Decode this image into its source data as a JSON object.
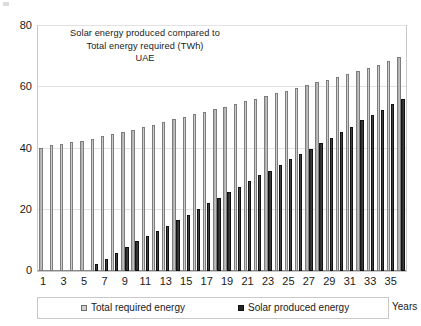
{
  "chart_data": {
    "type": "bar",
    "title": "Solar energy produced compared to Total energy required (TWh) UAE",
    "title_lines": [
      "Solar energy produced compared to",
      "Total energy required (TWh)",
      "UAE"
    ],
    "xlabel": "Years",
    "ylabel": "",
    "ylim": [
      0,
      80
    ],
    "yticks": [
      0,
      20,
      40,
      60,
      80
    ],
    "xticks": [
      1,
      3,
      5,
      7,
      9,
      11,
      13,
      15,
      17,
      19,
      21,
      23,
      25,
      27,
      29,
      31,
      33,
      35
    ],
    "grid": true,
    "legend_position": "bottom",
    "categories": [
      1,
      2,
      3,
      4,
      5,
      6,
      7,
      8,
      9,
      10,
      11,
      12,
      13,
      14,
      15,
      16,
      17,
      18,
      19,
      20,
      21,
      22,
      23,
      24,
      25,
      26,
      27,
      28,
      29,
      30,
      31,
      32,
      33,
      34,
      35,
      36
    ],
    "series": [
      {
        "name": "Total required energy",
        "color": "#bdbdbd",
        "values": [
          40.3,
          41.0,
          41.6,
          42.1,
          42.6,
          43.2,
          44.0,
          44.7,
          45.4,
          46.2,
          47.1,
          47.8,
          48.8,
          49.6,
          50.4,
          51.3,
          52.0,
          53.0,
          53.6,
          54.6,
          55.4,
          56.2,
          57.2,
          58.0,
          58.9,
          59.8,
          60.8,
          61.7,
          62.5,
          63.3,
          64.3,
          65.3,
          66.3,
          67.3,
          68.5,
          70.0
        ]
      },
      {
        "name": "Solar produced energy",
        "color": "#242424",
        "values": [
          0,
          0,
          0,
          0,
          0,
          2.2,
          3.8,
          5.8,
          7.9,
          9.7,
          11.5,
          13.0,
          14.8,
          16.8,
          18.4,
          20.3,
          22.2,
          23.8,
          25.8,
          27.4,
          29.5,
          31.3,
          32.8,
          34.7,
          36.5,
          38.3,
          40.0,
          41.7,
          43.4,
          45.3,
          47.1,
          49.2,
          51.0,
          52.6,
          54.4,
          56.2
        ]
      }
    ]
  },
  "legend": {
    "items": [
      {
        "label": "Total required energy",
        "swatch": "total"
      },
      {
        "label": "Solar produced energy",
        "swatch": "solar"
      }
    ],
    "axis_caption": "Years"
  }
}
